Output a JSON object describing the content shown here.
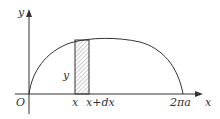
{
  "diagram": {
    "type": "area-element-under-curve",
    "labels": {
      "y_axis": "y",
      "x_axis": "x",
      "origin": "O",
      "strip_left": "x",
      "strip_right": "x+dx",
      "strip_height": "y",
      "end_point": "2πa"
    },
    "colors": {
      "line": "#333333",
      "hatch": "#888888",
      "background": "#ffffff"
    }
  }
}
